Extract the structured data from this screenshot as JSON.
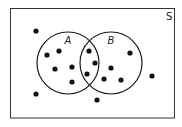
{
  "diagram": {
    "type": "venn",
    "universe_label": "S",
    "colors": {
      "stroke": "#1a1a1a",
      "dot": "#111111",
      "background": "#ffffff"
    },
    "sets": [
      {
        "label": "A",
        "cx": 68,
        "cy": 63,
        "r": 31,
        "label_x": 68,
        "label_y": 44
      },
      {
        "label": "B",
        "cx": 111,
        "cy": 63,
        "r": 31,
        "label_x": 111,
        "label_y": 44
      }
    ],
    "points": [
      {
        "x": 36,
        "y": 31,
        "region": "outside"
      },
      {
        "x": 47,
        "y": 55,
        "region": "A only"
      },
      {
        "x": 59,
        "y": 51,
        "region": "A only"
      },
      {
        "x": 55,
        "y": 69,
        "region": "A only"
      },
      {
        "x": 72,
        "y": 67,
        "region": "A only"
      },
      {
        "x": 72,
        "y": 82,
        "region": "A only"
      },
      {
        "x": 89,
        "y": 51,
        "region": "A and B"
      },
      {
        "x": 95,
        "y": 63,
        "region": "A and B"
      },
      {
        "x": 87,
        "y": 74,
        "region": "A and B"
      },
      {
        "x": 130,
        "y": 53,
        "region": "B only"
      },
      {
        "x": 111,
        "y": 68,
        "region": "B only"
      },
      {
        "x": 104,
        "y": 79,
        "region": "B only"
      },
      {
        "x": 121,
        "y": 80,
        "region": "B only"
      },
      {
        "x": 152,
        "y": 76,
        "region": "outside"
      },
      {
        "x": 36,
        "y": 94,
        "region": "outside"
      },
      {
        "x": 97,
        "y": 100,
        "region": "outside"
      }
    ],
    "counts": {
      "A_only": 5,
      "A_and_B": 3,
      "B_only": 4,
      "outside": 4,
      "total": 16
    }
  }
}
